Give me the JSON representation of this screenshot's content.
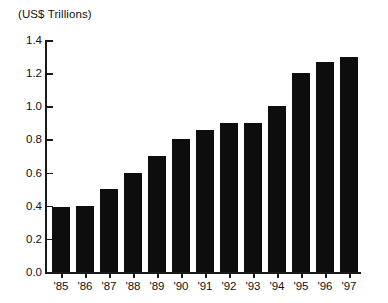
{
  "chart_data": {
    "type": "bar",
    "title": "(US$ Trillions)",
    "xlabel": "",
    "ylabel": "(US$ Trillions)",
    "categories": [
      "'85",
      "'86",
      "'87",
      "'88",
      "'89",
      "'90",
      "'91",
      "'92",
      "'93",
      "'94",
      "'95",
      "'96",
      "'97"
    ],
    "values": [
      0.39,
      0.4,
      0.5,
      0.6,
      0.7,
      0.8,
      0.86,
      0.9,
      0.9,
      1.0,
      1.2,
      1.27,
      1.3
    ],
    "ylim": [
      0.0,
      1.4
    ],
    "ytick_values": [
      0.0,
      0.2,
      0.4,
      0.6,
      0.8,
      1.0,
      1.2,
      1.4
    ],
    "ytick_labels": [
      "0.0",
      "0.2",
      "0.4",
      "0.6",
      "0.8",
      "1.0",
      "1.2",
      "1.4"
    ],
    "grid": false,
    "legend": null,
    "bar_color": "#0d0d0d",
    "axis_color": "#1a1a1a",
    "background": "#ffffff"
  }
}
